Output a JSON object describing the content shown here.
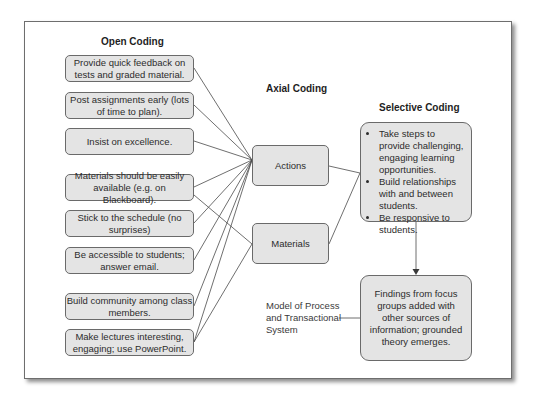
{
  "diagram": {
    "headings": {
      "open_coding": "Open Coding",
      "axial_coding": "Axial Coding",
      "selective_coding": "Selective Coding"
    },
    "open_codes": [
      {
        "text": "Provide quick feedback on tests and graded material.",
        "links_to": "Actions"
      },
      {
        "text": "Post assignments early (lots of time to plan).",
        "links_to": "Actions"
      },
      {
        "text": "Insist on excellence.",
        "links_to": "Actions"
      },
      {
        "text": "Materials should be easily available (e.g. on Blackboard).",
        "links_to": "Actions, Materials"
      },
      {
        "text": "Stick to the schedule (no surprises)",
        "links_to": "Actions"
      },
      {
        "text": "Be accessible to students; answer email.",
        "links_to": "Actions"
      },
      {
        "text": "Build community among class members.",
        "links_to": "Actions"
      },
      {
        "text": "Make lectures interesting, engaging; use PowerPoint.",
        "links_to": "Actions, Materials"
      }
    ],
    "axial_codes": [
      {
        "text": "Actions"
      },
      {
        "text": "Materials"
      }
    ],
    "selective_codes": [
      "Take steps to provide challenging, engaging learning opportunities.",
      "Build relationships with and between students.",
      "Be responsive to students."
    ],
    "findings": "Findings from focus groups added with other sources of information; grounded theory emerges.",
    "model_label": "Model of Process and Transactional System"
  }
}
